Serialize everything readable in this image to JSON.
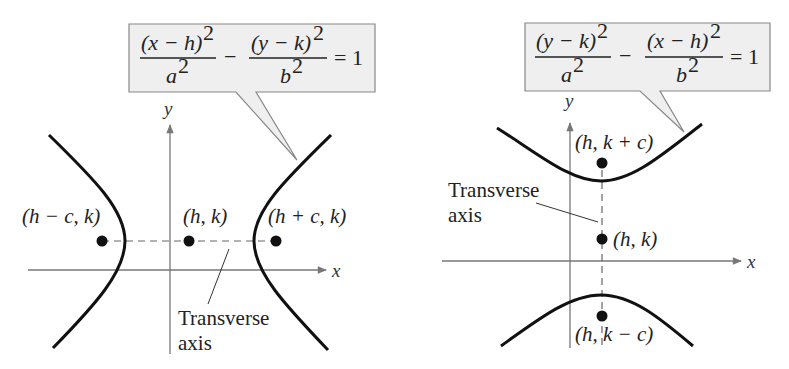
{
  "figure": "Standard forms of the equation of a hyperbola with center (h, k)",
  "diagrams": [
    {
      "id": "horizontal",
      "orientation": "horizontal transverse axis",
      "equation": {
        "term1_num": "(x − h)",
        "term1_den": "a",
        "term2_num": "(y − k)",
        "term2_den": "b",
        "exp": "2",
        "minus": "−",
        "rhs": "= 1"
      },
      "axes": {
        "x_label": "x",
        "y_label": "y"
      },
      "points": {
        "left_focus": "(h − c, k)",
        "center": "(h, k)",
        "right_focus": "(h + c, k)"
      },
      "transverse_label": [
        "Transverse",
        "axis"
      ]
    },
    {
      "id": "vertical",
      "orientation": "vertical transverse axis",
      "equation": {
        "term1_num": "(y − k)",
        "term1_den": "a",
        "term2_num": "(x − h)",
        "term2_den": "b",
        "exp": "2",
        "minus": "−",
        "rhs": "= 1"
      },
      "axes": {
        "x_label": "x",
        "y_label": "y"
      },
      "points": {
        "top_focus": "(h, k + c)",
        "center": "(h, k)",
        "bottom_focus": "(h, k − c)"
      },
      "transverse_label": [
        "Transverse",
        "axis"
      ]
    }
  ],
  "colors": {
    "curve": "#111111",
    "axis": "#777777",
    "callout_fill": "#efefef",
    "callout_border": "#888888",
    "text": "#222222"
  }
}
